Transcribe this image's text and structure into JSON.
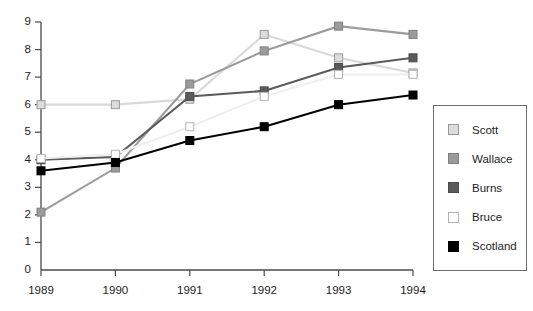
{
  "chart_data": {
    "type": "line",
    "title": "",
    "xlabel": "",
    "ylabel": "",
    "categories": [
      "1989",
      "1990",
      "1991",
      "1992",
      "1993",
      "1994"
    ],
    "x": [
      1989,
      1990,
      1991,
      1992,
      1993,
      1994
    ],
    "ylim": [
      0,
      9
    ],
    "yticks": [
      0,
      1,
      2,
      3,
      4,
      5,
      6,
      7,
      8,
      9
    ],
    "ytick_labels": [
      "0",
      "1",
      "2",
      "3",
      "4",
      "5",
      "6",
      "7",
      "8",
      "9"
    ],
    "xtick_labels": [
      "1989",
      "1990",
      "1991",
      "1992",
      "1993",
      "1994"
    ],
    "grid": false,
    "legend_position": "right",
    "marker": "square",
    "series": [
      {
        "name": "Scott",
        "color": "#d9d9d9",
        "marker_fill": "#dcdcdc",
        "marker_edge": "#9a9a9a",
        "values": [
          6.0,
          6.0,
          6.2,
          8.55,
          7.7,
          7.15
        ]
      },
      {
        "name": "Wallace",
        "color": "#9b9b9b",
        "marker_fill": "#9b9b9b",
        "marker_edge": "#808080",
        "values": [
          2.1,
          3.7,
          6.75,
          7.95,
          8.85,
          8.55
        ]
      },
      {
        "name": "Burns",
        "color": "#5a5a5a",
        "marker_fill": "#5a5a5a",
        "marker_edge": "#4a4a4a",
        "values": [
          4.0,
          4.1,
          6.3,
          6.5,
          7.35,
          7.7
        ]
      },
      {
        "name": "Bruce",
        "color": "#efefef",
        "marker_fill": "#ffffff",
        "marker_edge": "#b4b4b4",
        "values": [
          4.05,
          4.2,
          5.2,
          6.3,
          7.1,
          7.1
        ]
      },
      {
        "name": "Scotland",
        "color": "#000000",
        "marker_fill": "#000000",
        "marker_edge": "#000000",
        "values": [
          3.6,
          3.9,
          4.7,
          5.2,
          6.0,
          6.35
        ]
      }
    ]
  },
  "legend": {
    "items": [
      {
        "label": "Scott"
      },
      {
        "label": "Wallace"
      },
      {
        "label": "Burns"
      },
      {
        "label": "Bruce"
      },
      {
        "label": "Scotland"
      }
    ]
  }
}
